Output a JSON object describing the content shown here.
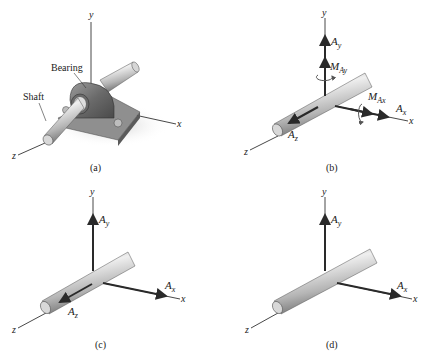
{
  "figure": {
    "panels": [
      {
        "id": "a",
        "caption": "(a)",
        "axes": {
          "x": "x",
          "y": "y",
          "z": "z"
        },
        "callouts": {
          "bearing": "Bearing",
          "shaft": "Shaft"
        }
      },
      {
        "id": "b",
        "caption": "(b)",
        "axes": {
          "x": "x",
          "y": "y",
          "z": "z"
        },
        "forces": {
          "Ay": {
            "main": "A",
            "sub": "y"
          },
          "Ax": {
            "main": "A",
            "sub": "x"
          },
          "Az": {
            "main": "A",
            "sub": "z"
          }
        },
        "moments": {
          "MAy": {
            "main": "M",
            "sub": "Ay"
          },
          "MAx": {
            "main": "M",
            "sub": "Ax"
          }
        }
      },
      {
        "id": "c",
        "caption": "(c)",
        "axes": {
          "x": "x",
          "y": "y",
          "z": "z"
        },
        "forces": {
          "Ay": {
            "main": "A",
            "sub": "y"
          },
          "Ax": {
            "main": "A",
            "sub": "x"
          },
          "Az": {
            "main": "A",
            "sub": "z"
          }
        }
      },
      {
        "id": "d",
        "caption": "(d)",
        "axes": {
          "x": "x",
          "y": "y",
          "z": "z"
        },
        "forces": {
          "Ay": {
            "main": "A",
            "sub": "y"
          },
          "Ax": {
            "main": "A",
            "sub": "x"
          }
        }
      }
    ]
  },
  "colors": {
    "shaft_light": "#e4e4e4",
    "shaft_mid": "#b9b9b9",
    "shaft_dark": "#7a7a7a",
    "bearing_dark": "#5e5e5e",
    "bearing_mid": "#8a8a8a",
    "force": "#2a2a2a"
  }
}
